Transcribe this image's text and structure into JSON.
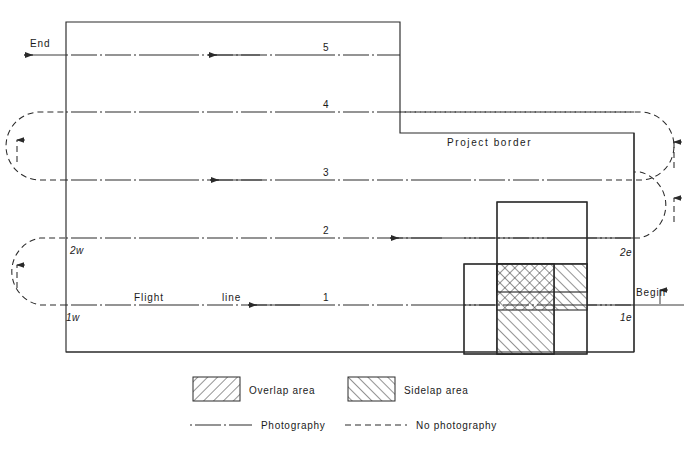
{
  "diagram": {
    "border_label": "Project    border",
    "begin_label": "Begin",
    "end_label": "End",
    "flight_line_label_a": "Flight",
    "flight_line_label_b": "line",
    "flight_lines": [
      {
        "id": "1",
        "number": "1",
        "y": 305,
        "west_tick": "1w",
        "east_tick": "1e"
      },
      {
        "id": "2",
        "number": "2",
        "y": 238,
        "west_tick": "2w",
        "east_tick": "2e"
      },
      {
        "id": "3",
        "number": "3",
        "y": 180,
        "west_tick": "",
        "east_tick": ""
      },
      {
        "id": "4",
        "number": "4",
        "y": 112,
        "west_tick": "",
        "east_tick": ""
      },
      {
        "id": "5",
        "number": "5",
        "y": 55,
        "west_tick": "",
        "east_tick": ""
      }
    ],
    "end_tick_labels": [
      "1w",
      "2w",
      "1e",
      "2e"
    ]
  },
  "legend": {
    "items": [
      {
        "key": "overlap",
        "label": "Overlap area",
        "hatch": "backslash"
      },
      {
        "key": "sidelap",
        "label": "Sidelap area",
        "hatch": "forwardslash"
      }
    ],
    "lines": [
      {
        "key": "photography",
        "label": "Photography",
        "style": "dash-dot"
      },
      {
        "key": "no-photography",
        "label": "No photography",
        "style": "dashed"
      }
    ]
  },
  "colors": {
    "ink": "#2a2a2a",
    "paper": "#ffffff",
    "hatch": "#3a3a3a"
  }
}
